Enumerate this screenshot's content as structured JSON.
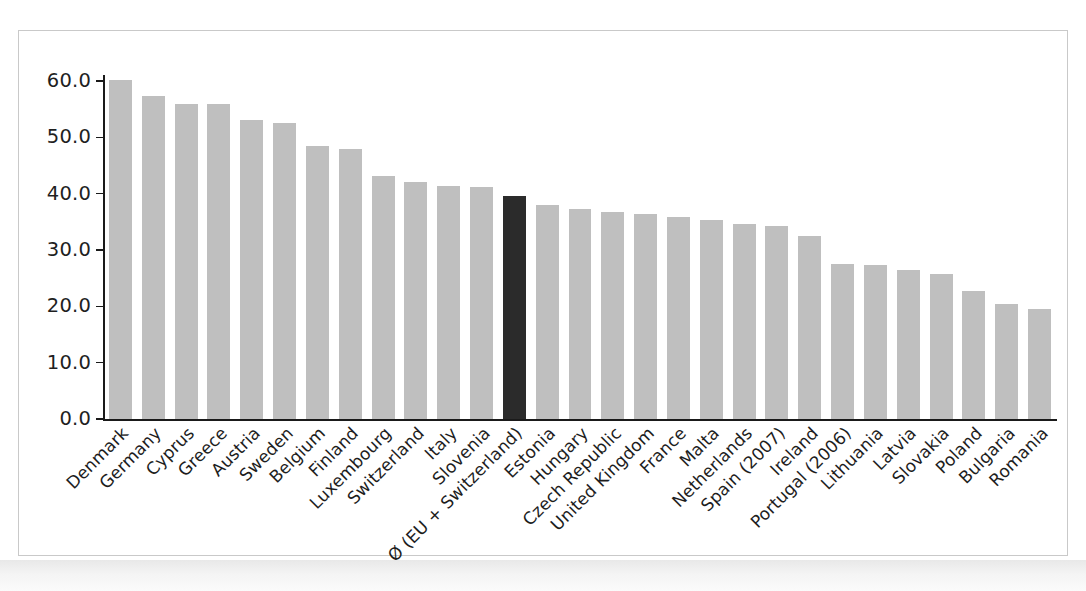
{
  "chart_data": {
    "type": "bar",
    "title": "",
    "subtitle": "",
    "xlabel": "",
    "ylabel": "",
    "ylim": [
      0.0,
      60.0
    ],
    "ytick_labels": [
      "0.0",
      "10.0",
      "20.0",
      "30.0",
      "40.0",
      "50.0",
      "60.0"
    ],
    "ytick_values": [
      0.0,
      10.0,
      20.0,
      30.0,
      40.0,
      50.0,
      60.0
    ],
    "grid": false,
    "legend": null,
    "legend_position": "none",
    "bar_color": "#bfbfbf",
    "highlight_color": "#2b2b2b",
    "highlight_category": "Ø (EU + Switzerland)",
    "categories": [
      "Denmark",
      "Germany",
      "Cyprus",
      "Greece",
      "Austria",
      "Sweden",
      "Belgium",
      "Finland",
      "Luxembourg",
      "Switzerland",
      "Italy",
      "Slovenia",
      "Ø (EU + Switzerland)",
      "Estonia",
      "Hungary",
      "Czech Republic",
      "United Kingdom",
      "France",
      "Malta",
      "Netherlands",
      "Spain (2007)",
      "Ireland",
      "Portugal (2006)",
      "Lithuania",
      "Latvia",
      "Slovakia",
      "Poland",
      "Bulgaria",
      "Romania"
    ],
    "values": [
      60.2,
      57.3,
      56.0,
      55.9,
      53.0,
      52.6,
      48.5,
      47.9,
      43.1,
      42.0,
      41.4,
      41.2,
      39.5,
      38.0,
      37.3,
      36.7,
      36.4,
      35.8,
      35.4,
      34.6,
      34.3,
      32.4,
      27.6,
      27.4,
      26.5,
      25.7,
      22.8,
      20.4,
      19.6
    ]
  },
  "figure": {
    "frame_color": "#c9c9c9",
    "background": "#ffffff",
    "axis_color": "#1a1a1a"
  }
}
